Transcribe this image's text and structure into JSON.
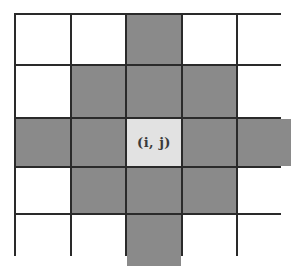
{
  "diagram": {
    "title": "",
    "rows": 5,
    "cols": 5,
    "center_label": "(i, j)",
    "colors": {
      "empty": "#ffffff",
      "neighbor": "#8a8a8a",
      "center": "#e2e2e2",
      "border": "#2a2a2a"
    },
    "cells": [
      [
        "empty",
        "empty",
        "neighbor",
        "empty",
        "empty"
      ],
      [
        "empty",
        "neighbor",
        "neighbor",
        "neighbor",
        "empty"
      ],
      [
        "neighbor",
        "neighbor",
        "center",
        "neighbor",
        "neighbor"
      ],
      [
        "empty",
        "neighbor",
        "neighbor",
        "neighbor",
        "empty"
      ],
      [
        "empty",
        "empty",
        "neighbor",
        "empty",
        "empty"
      ]
    ]
  }
}
